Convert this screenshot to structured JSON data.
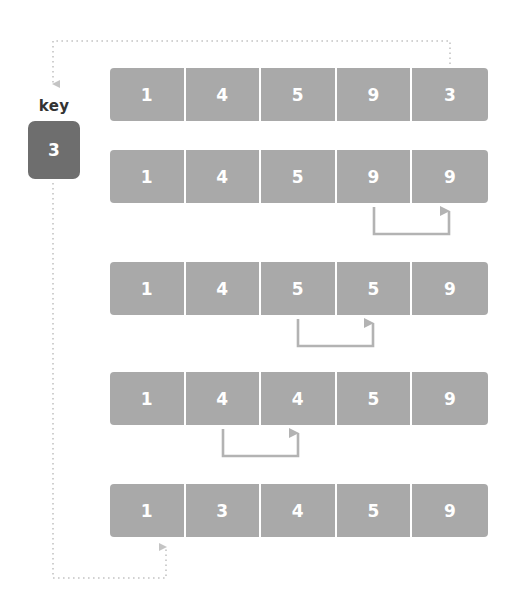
{
  "diagram": {
    "colors": {
      "cell_fill": "#a9a9a9",
      "cell_text": "#ffffff",
      "key_fill": "#6e6e6e",
      "key_text": "#ffffff",
      "label_text": "#333333",
      "arrow": "#b3b3b3",
      "dotted": "#c4c4c4",
      "background": "#ffffff"
    },
    "key": {
      "label": "key",
      "value": "3"
    },
    "rows": [
      {
        "id": "row-1",
        "top": 68,
        "cells": [
          "1",
          "4",
          "5",
          "9",
          "3"
        ]
      },
      {
        "id": "row-2",
        "top": 150,
        "cells": [
          "1",
          "4",
          "5",
          "9",
          "9"
        ]
      },
      {
        "id": "row-3",
        "top": 262,
        "cells": [
          "1",
          "4",
          "5",
          "5",
          "9"
        ]
      },
      {
        "id": "row-4",
        "top": 372,
        "cells": [
          "1",
          "4",
          "4",
          "5",
          "9"
        ]
      },
      {
        "id": "row-5",
        "top": 484,
        "cells": [
          "1",
          "3",
          "4",
          "5",
          "9"
        ]
      }
    ],
    "shift_arrows": [
      {
        "id": "shift-arrow-row-2",
        "from_index": 3,
        "to_index": 4,
        "row": 2
      },
      {
        "id": "shift-arrow-row-3",
        "from_index": 2,
        "to_index": 3,
        "row": 3
      },
      {
        "id": "shift-arrow-row-4",
        "from_index": 1,
        "to_index": 2,
        "row": 4
      }
    ],
    "dotted_paths": [
      {
        "id": "key-extract-path",
        "description": "from last cell of row 1 up and left to key box"
      },
      {
        "id": "key-insert-path",
        "description": "from key box down and right up into cell 2 of row 5"
      }
    ]
  }
}
